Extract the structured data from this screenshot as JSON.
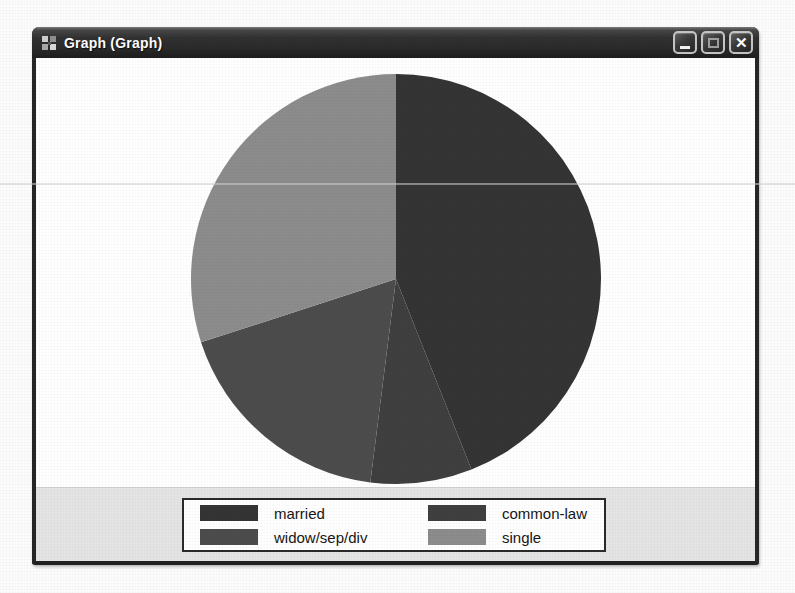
{
  "window": {
    "title": "Graph (Graph)",
    "controls": {
      "close_glyph": "✕"
    }
  },
  "chart_data": {
    "type": "pie",
    "title": "",
    "categories": [
      "married",
      "common-law",
      "widow/sep/div",
      "single"
    ],
    "values": [
      44,
      8,
      18,
      30
    ],
    "unit": "percent (estimated from slice angles)",
    "colors": [
      "#343434",
      "#3f3f3f",
      "#4c4c4c",
      "#8c8c8c"
    ],
    "start_angle_deg": 0,
    "direction": "clockwise",
    "legend_position": "bottom"
  },
  "legend": {
    "items": [
      {
        "label": "married",
        "color": "#343434"
      },
      {
        "label": "common-law",
        "color": "#3f3f3f"
      },
      {
        "label": "widow/sep/div",
        "color": "#4c4c4c"
      },
      {
        "label": "single",
        "color": "#8c8c8c"
      }
    ]
  }
}
